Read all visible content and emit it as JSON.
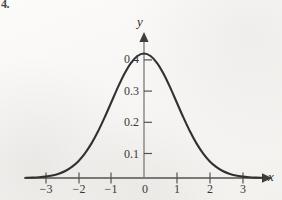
{
  "figure": {
    "problem_number": "4.",
    "background_color": "#f7f6f4",
    "curve_color": "#33312f",
    "axis_color": "#55524f"
  },
  "chart_data": {
    "type": "line",
    "title": "",
    "subtitle": "",
    "xlabel": "x",
    "ylabel": "y",
    "grid": false,
    "legend": null,
    "xlim": [
      -3.6,
      3.6
    ],
    "ylim": [
      0,
      0.44
    ],
    "xticks": [
      -3,
      -2,
      -1,
      0,
      1,
      2,
      3
    ],
    "xtick_labels": [
      "−3",
      "−2",
      "−1",
      "0",
      "1",
      "2",
      "3"
    ],
    "yticks": [
      0.1,
      0.2,
      0.3,
      0.4
    ],
    "ytick_labels": [
      "0.1",
      "0.2",
      "0.3",
      "0.4"
    ],
    "x_axis_arrow": true,
    "y_axis_arrow": true,
    "series": [
      {
        "name": "normal density",
        "x": [
          -3.6,
          -3.4,
          -3.2,
          -3.0,
          -2.8,
          -2.6,
          -2.4,
          -2.2,
          -2.0,
          -1.8,
          -1.6,
          -1.4,
          -1.2,
          -1.0,
          -0.8,
          -0.6,
          -0.4,
          -0.2,
          0.0,
          0.2,
          0.4,
          0.6,
          0.8,
          1.0,
          1.2,
          1.4,
          1.6,
          1.8,
          2.0,
          2.2,
          2.4,
          2.6,
          2.8,
          3.0,
          3.2,
          3.4,
          3.6
        ],
        "y": [
          0.0006,
          0.0012,
          0.0024,
          0.0044,
          0.0079,
          0.0136,
          0.0224,
          0.0355,
          0.054,
          0.079,
          0.1109,
          0.1497,
          0.1942,
          0.242,
          0.2897,
          0.3332,
          0.3683,
          0.391,
          0.3989,
          0.391,
          0.3683,
          0.3332,
          0.2897,
          0.242,
          0.1942,
          0.1497,
          0.1109,
          0.079,
          0.054,
          0.0355,
          0.0224,
          0.0136,
          0.0079,
          0.0044,
          0.0024,
          0.0012,
          0.0006
        ],
        "peak_x": 0,
        "peak_y": 0.3989
      }
    ]
  }
}
